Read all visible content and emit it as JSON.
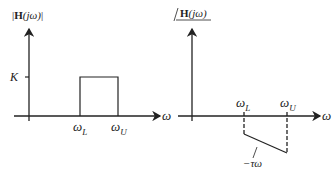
{
  "magnitude_plot": {
    "ylabel_prefix": "|",
    "ylabel_H": "H",
    "ylabel_arg": "(jω)",
    "ylabel_suffix": "|",
    "level_label": "K",
    "xlabel": "ω",
    "lower_cutoff": {
      "symbol": "ω",
      "sub": "L"
    },
    "upper_cutoff": {
      "symbol": "ω",
      "sub": "U"
    }
  },
  "phase_plot": {
    "ylabel_angle": "∠",
    "ylabel_H": "H",
    "ylabel_arg": "(jω)",
    "xlabel": "ω",
    "lower_cutoff": {
      "symbol": "ω",
      "sub": "L"
    },
    "upper_cutoff": {
      "symbol": "ω",
      "sub": "U"
    },
    "slope_label": "−τω"
  },
  "colors": {
    "line": "#222222",
    "background": "#ffffff"
  }
}
